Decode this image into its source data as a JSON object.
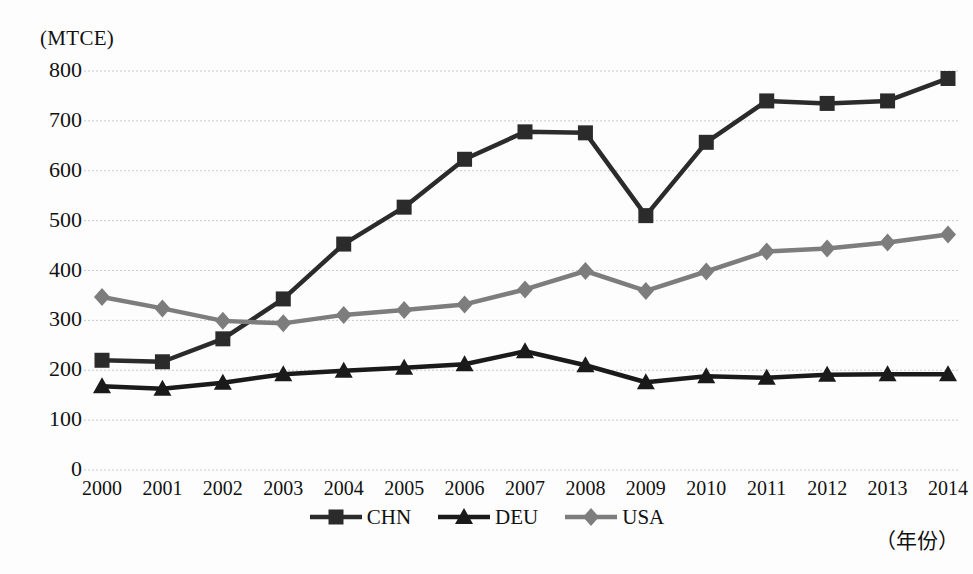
{
  "axes": {
    "y_unit_label": "(MTCE)",
    "x_title": "（年份）",
    "y_ticks": [
      "800",
      "700",
      "600",
      "500",
      "400",
      "300",
      "200",
      "100",
      "0"
    ],
    "x_ticks": [
      "2000",
      "2001",
      "2002",
      "2003",
      "2004",
      "2005",
      "2006",
      "2007",
      "2008",
      "2009",
      "2010",
      "2011",
      "2012",
      "2013",
      "2014"
    ]
  },
  "legend": {
    "position": "bottom-center",
    "items": [
      {
        "label": "CHN",
        "marker": "square-marker",
        "color": "#2b2b2b"
      },
      {
        "label": "DEU",
        "marker": "triangle-marker",
        "color": "#1a1a1a"
      },
      {
        "label": "USA",
        "marker": "diamond-marker",
        "color": "#7d7d7d"
      }
    ]
  },
  "colors": {
    "chn": "#2b2b2b",
    "deu": "#1a1a1a",
    "usa": "#7d7d7d",
    "gridline": "#c9c9c9",
    "background": "#fdfdfd",
    "text": "#111111"
  },
  "chart_data": {
    "type": "line",
    "title": "",
    "subtitle": "",
    "xlabel": "（年份）",
    "ylabel": "(MTCE)",
    "x": [
      2000,
      2001,
      2002,
      2003,
      2004,
      2005,
      2006,
      2007,
      2008,
      2009,
      2010,
      2011,
      2012,
      2013,
      2014
    ],
    "categories": [
      "2000",
      "2001",
      "2002",
      "2003",
      "2004",
      "2005",
      "2006",
      "2007",
      "2008",
      "2009",
      "2010",
      "2011",
      "2012",
      "2013",
      "2014"
    ],
    "series": [
      {
        "name": "CHN",
        "marker": "square",
        "color": "#2b2b2b",
        "values": [
          220,
          217,
          263,
          343,
          453,
          527,
          623,
          678,
          676,
          510,
          657,
          740,
          735,
          740,
          785
        ]
      },
      {
        "name": "DEU",
        "marker": "triangle",
        "color": "#1a1a1a",
        "values": [
          168,
          163,
          175,
          192,
          199,
          205,
          212,
          238,
          210,
          176,
          188,
          185,
          191,
          192,
          192
        ]
      },
      {
        "name": "USA",
        "marker": "diamond",
        "color": "#7d7d7d",
        "values": [
          347,
          324,
          299,
          294,
          311,
          321,
          332,
          362,
          399,
          359,
          398,
          438,
          444,
          456,
          472
        ]
      }
    ],
    "xlim": [
      2000,
      2014
    ],
    "ylim": [
      0,
      800
    ],
    "y_ticks": [
      0,
      100,
      200,
      300,
      400,
      500,
      600,
      700,
      800
    ],
    "grid": {
      "horizontal": true,
      "vertical": false
    },
    "legend_position": "bottom-center"
  }
}
